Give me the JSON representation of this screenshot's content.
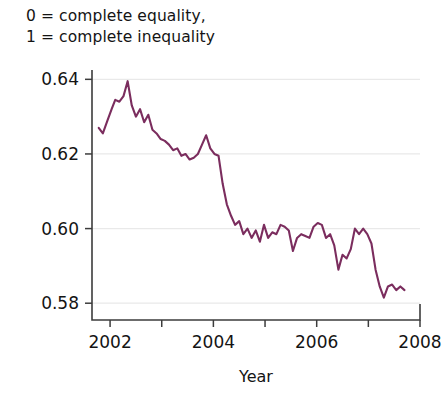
{
  "caption": {
    "line1": "0 = complete equality,",
    "line2": "1 = complete inequality"
  },
  "axis_title_x": "Year",
  "colors": {
    "line": "#7B2D5E",
    "axis": "#3c3c3c",
    "grid": "#e9e9e9",
    "text": "#141414",
    "background": "#ffffff"
  },
  "chart_data": {
    "type": "line",
    "title": "",
    "subtitle": "0 = complete equality, 1 = complete inequality",
    "xlabel": "Year",
    "ylabel": "",
    "xlim": [
      2001.65,
      2008.0
    ],
    "ylim": [
      0.5755,
      0.6425
    ],
    "grid": true,
    "legend": null,
    "xticks": [
      2002,
      2004,
      2006,
      2008
    ],
    "xtick_labels": [
      "2002",
      "2004",
      "2006",
      "2008"
    ],
    "xminorticks": [
      2003,
      2005,
      2007
    ],
    "yticks": [
      0.58,
      0.6,
      0.62,
      0.64
    ],
    "ytick_labels": [
      "0.58",
      "0.60",
      "0.62",
      "0.64"
    ],
    "series": [
      {
        "name": "Gini coefficient",
        "color": "#7B2D5E",
        "x": [
          2001.78,
          2001.86,
          2001.95,
          2002.03,
          2002.1,
          2002.18,
          2002.26,
          2002.34,
          2002.42,
          2002.5,
          2002.58,
          2002.66,
          2002.74,
          2002.82,
          2002.9,
          2002.98,
          2003.06,
          2003.14,
          2003.22,
          2003.3,
          2003.38,
          2003.46,
          2003.54,
          2003.62,
          2003.7,
          2003.78,
          2003.86,
          2003.94,
          2004.02,
          2004.1,
          2004.18,
          2004.26,
          2004.34,
          2004.42,
          2004.5,
          2004.58,
          2004.66,
          2004.74,
          2004.82,
          2004.9,
          2004.98,
          2005.06,
          2005.14,
          2005.22,
          2005.3,
          2005.38,
          2005.46,
          2005.54,
          2005.62,
          2005.7,
          2005.78,
          2005.86,
          2005.94,
          2006.02,
          2006.1,
          2006.18,
          2006.26,
          2006.34,
          2006.42,
          2006.5,
          2006.58,
          2006.66,
          2006.74,
          2006.82,
          2006.9,
          2006.98,
          2007.06,
          2007.14,
          2007.22,
          2007.3,
          2007.38,
          2007.46,
          2007.54,
          2007.62,
          2007.7
        ],
        "y": [
          0.627,
          0.6255,
          0.629,
          0.632,
          0.6345,
          0.634,
          0.6355,
          0.6395,
          0.633,
          0.63,
          0.632,
          0.6285,
          0.6305,
          0.6265,
          0.6255,
          0.624,
          0.6235,
          0.6225,
          0.621,
          0.6215,
          0.6195,
          0.62,
          0.6185,
          0.619,
          0.62,
          0.6225,
          0.625,
          0.6215,
          0.62,
          0.6195,
          0.612,
          0.6065,
          0.6035,
          0.601,
          0.602,
          0.5985,
          0.6,
          0.5975,
          0.5995,
          0.5965,
          0.601,
          0.5975,
          0.599,
          0.5985,
          0.601,
          0.6005,
          0.5995,
          0.594,
          0.5975,
          0.5985,
          0.598,
          0.5975,
          0.6005,
          0.6015,
          0.601,
          0.5975,
          0.5985,
          0.5955,
          0.589,
          0.593,
          0.592,
          0.5945,
          0.6,
          0.5985,
          0.6,
          0.5985,
          0.596,
          0.589,
          0.5845,
          0.5815,
          0.5845,
          0.585,
          0.5835,
          0.5845,
          0.5835
        ]
      }
    ]
  }
}
